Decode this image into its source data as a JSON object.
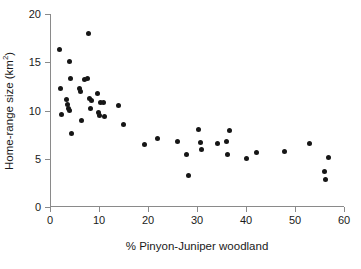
{
  "chart_data": {
    "type": "scatter",
    "title": "",
    "xlabel": "% Pinyon-Juniper woodland",
    "ylabel_prefix": "Home-range size (km",
    "ylabel_sup": "2",
    "ylabel_suffix": ")",
    "ylabel_full": "Home-range size (km2)",
    "xlim": [
      0,
      60
    ],
    "ylim": [
      0,
      20
    ],
    "xticks": [
      0,
      10,
      20,
      30,
      40,
      50,
      60
    ],
    "yticks": [
      0,
      5,
      10,
      15,
      20
    ],
    "xticklabels": [
      "0",
      "10",
      "20",
      "30",
      "40",
      "50",
      "60"
    ],
    "yticklabels": [
      "0",
      "5",
      "10",
      "15",
      "20"
    ],
    "grid": false,
    "legend": null,
    "marker": "filled-circle",
    "marker_color": "#161616",
    "axis_color": "#8a8a8a",
    "series": [
      {
        "name": "Home-range size vs Pinyon-Juniper woodland",
        "points": [
          [
            2.0,
            16.3
          ],
          [
            2.2,
            12.3
          ],
          [
            2.4,
            9.6
          ],
          [
            3.3,
            11.1
          ],
          [
            3.6,
            10.6
          ],
          [
            3.8,
            10.2
          ],
          [
            3.9,
            10.0
          ],
          [
            4.0,
            15.1
          ],
          [
            4.2,
            13.3
          ],
          [
            4.3,
            7.6
          ],
          [
            6.0,
            12.3
          ],
          [
            6.3,
            12.0
          ],
          [
            6.4,
            9.0
          ],
          [
            7.0,
            13.2
          ],
          [
            7.6,
            13.3
          ],
          [
            7.8,
            18.0
          ],
          [
            8.0,
            11.2
          ],
          [
            8.2,
            10.2
          ],
          [
            8.4,
            11.0
          ],
          [
            9.6,
            11.8
          ],
          [
            9.8,
            9.8
          ],
          [
            10.2,
            9.5
          ],
          [
            10.3,
            10.8
          ],
          [
            11.0,
            10.8
          ],
          [
            11.2,
            9.4
          ],
          [
            14.0,
            10.5
          ],
          [
            15.0,
            8.6
          ],
          [
            19.3,
            6.5
          ],
          [
            21.9,
            7.1
          ],
          [
            26.1,
            6.8
          ],
          [
            27.8,
            5.4
          ],
          [
            28.2,
            3.3
          ],
          [
            30.3,
            8.0
          ],
          [
            30.8,
            6.7
          ],
          [
            31.0,
            6.0
          ],
          [
            34.2,
            6.6
          ],
          [
            36.0,
            6.8
          ],
          [
            36.3,
            5.4
          ],
          [
            36.6,
            7.9
          ],
          [
            40.1,
            5.0
          ],
          [
            42.1,
            5.6
          ],
          [
            47.8,
            5.8
          ],
          [
            52.9,
            6.6
          ],
          [
            56.1,
            3.7
          ],
          [
            56.2,
            2.8
          ],
          [
            56.8,
            5.1
          ]
        ]
      }
    ]
  }
}
